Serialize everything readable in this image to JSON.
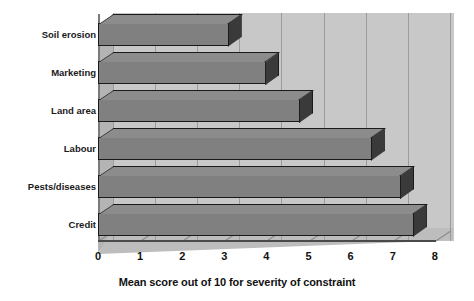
{
  "chart_data": {
    "type": "bar",
    "orientation": "horizontal",
    "style": "3d",
    "title": "",
    "xlabel": "Mean score out of 10 for severity of constraint",
    "ylabel": "",
    "categories": [
      "Credit",
      "Pests/diseases",
      "Labour",
      "Land area",
      "Marketing",
      "Soil erosion"
    ],
    "values": [
      7.5,
      7.2,
      6.5,
      4.8,
      4.0,
      3.1
    ],
    "xlim": [
      0,
      8
    ],
    "ylim": null,
    "xticks": [
      "0",
      "1",
      "2",
      "3",
      "4",
      "5",
      "6",
      "7",
      "8"
    ],
    "grid": "vertical",
    "legend": null,
    "colors": {
      "bar_face": "#808080",
      "bar_top": "#8c8c8c",
      "bar_side": "#3a3a3a",
      "bar_outline": "#1a1a1a",
      "plot_background": "#c8c8c8",
      "floor": "#bdbdbd",
      "gridline": "#9c9c9c",
      "text": "#111111",
      "page_background": "#ffffff"
    }
  },
  "axis": {
    "x_title": "Mean score out of 10 for severity of constraint",
    "ticks": [
      {
        "label": "0",
        "value": 0
      },
      {
        "label": "1",
        "value": 1
      },
      {
        "label": "2",
        "value": 2
      },
      {
        "label": "3",
        "value": 3
      },
      {
        "label": "4",
        "value": 4
      },
      {
        "label": "5",
        "value": 5
      },
      {
        "label": "6",
        "value": 6
      },
      {
        "label": "7",
        "value": 7
      },
      {
        "label": "8",
        "value": 8
      }
    ]
  },
  "bars": [
    {
      "label": "Soil erosion",
      "value": 3.1
    },
    {
      "label": "Marketing",
      "value": 4.0
    },
    {
      "label": "Land area",
      "value": 4.8
    },
    {
      "label": "Labour",
      "value": 6.5
    },
    {
      "label": "Pests/diseases",
      "value": 7.2
    },
    {
      "label": "Credit",
      "value": 7.5
    }
  ]
}
